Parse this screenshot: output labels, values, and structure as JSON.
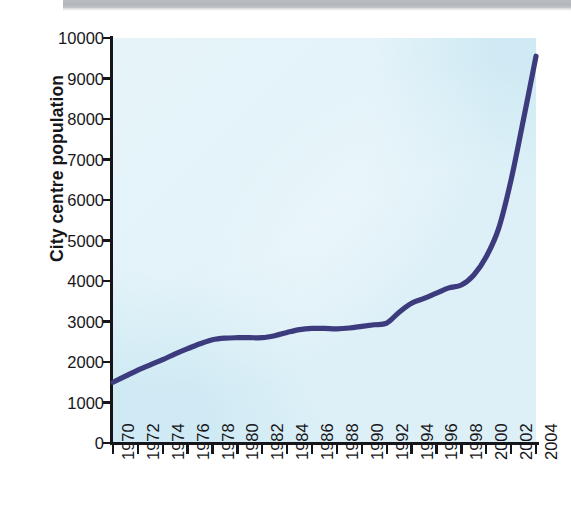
{
  "chart_data": {
    "type": "line",
    "title": "",
    "xlabel": "",
    "ylabel": "City centre population",
    "xlim": [
      1970,
      2004
    ],
    "ylim": [
      0,
      10000
    ],
    "grid": false,
    "legend": null,
    "line_color": "#3c3b7d",
    "plot_background": "#cfeaf4",
    "x_tick_labels": [
      "1970",
      "1972",
      "1974",
      "1976",
      "1978",
      "1980",
      "1982",
      "1984",
      "1986",
      "1988",
      "1990",
      "1992",
      "1994",
      "1996",
      "1998",
      "2000",
      "2002",
      "2004"
    ],
    "y_tick_labels": [
      "0",
      "1000",
      "2000",
      "3000",
      "4000",
      "5000",
      "6000",
      "7000",
      "8000",
      "9000",
      "10000"
    ],
    "y_tick_values": [
      0,
      1000,
      2000,
      3000,
      4000,
      5000,
      6000,
      7000,
      8000,
      9000,
      10000
    ],
    "x": [
      1970,
      1971,
      1972,
      1973,
      1974,
      1975,
      1976,
      1977,
      1978,
      1979,
      1980,
      1981,
      1982,
      1983,
      1984,
      1985,
      1986,
      1987,
      1988,
      1989,
      1990,
      1991,
      1992,
      1993,
      1994,
      1995,
      1996,
      1997,
      1998,
      1999,
      2000,
      2001,
      2002,
      2003,
      2004
    ],
    "values": [
      1500,
      1650,
      1800,
      1930,
      2060,
      2200,
      2330,
      2450,
      2550,
      2590,
      2600,
      2600,
      2600,
      2650,
      2730,
      2800,
      2830,
      2830,
      2820,
      2840,
      2880,
      2920,
      2960,
      3230,
      3450,
      3570,
      3700,
      3830,
      3900,
      4150,
      4600,
      5300,
      6500,
      8000,
      9550
    ],
    "annotations": []
  },
  "figure": {
    "y_axis_title": "City centre population"
  }
}
